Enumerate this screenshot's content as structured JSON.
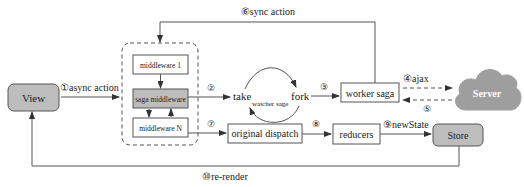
{
  "diagram": {
    "nodes": {
      "view": "View",
      "middleware_1": "middleware 1",
      "saga_middleware": "saga middleware",
      "middleware_n": "middleware N",
      "take": "take",
      "fork": "fork",
      "watcher": "watcher sage",
      "worker_saga": "worker saga",
      "server": "Server",
      "original_dispatch": "original dispatch",
      "reducers": "reducers",
      "store": "Store"
    },
    "edges": {
      "e1": "①async action",
      "e2": "②",
      "e3": "③",
      "e4": "④ajax",
      "e5": "⑤",
      "e6": "⑥sync action",
      "e7": "⑦",
      "e8": "⑧",
      "e9": "⑨newState",
      "e10": "⑩re-render"
    },
    "colors": {
      "gray_fill": "#bdbdbd",
      "cloud_fill": "#9e9e9e",
      "stroke": "#555555"
    }
  }
}
